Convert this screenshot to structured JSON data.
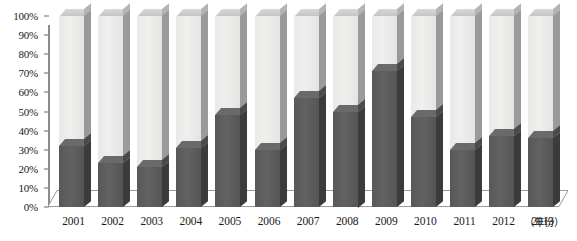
{
  "chart_data": {
    "type": "bar",
    "title": "",
    "subtitle": "",
    "xlabel": "（年份）",
    "ylabel": "",
    "ylim": [
      0,
      100
    ],
    "grid": false,
    "legend_position": "none",
    "stacked": true,
    "y_unit": "%",
    "categories": [
      "2001",
      "2002",
      "2003",
      "2004",
      "2005",
      "2006",
      "2007",
      "2008",
      "2009",
      "2010",
      "2011",
      "2012",
      "2013"
    ],
    "y_ticks": [
      "0%",
      "10%",
      "20%",
      "30%",
      "40%",
      "50%",
      "60%",
      "70%",
      "80%",
      "90%",
      "100%"
    ],
    "y_tick_values": [
      0,
      10,
      20,
      30,
      40,
      50,
      60,
      70,
      80,
      90,
      100
    ],
    "series": [
      {
        "name": "dark-segment",
        "color": "#5a5a5a",
        "values": [
          32,
          23,
          21,
          31,
          48,
          30,
          57,
          50,
          71,
          47,
          30,
          37,
          36
        ]
      },
      {
        "name": "light-segment",
        "color": "#ececea",
        "values": [
          68,
          77,
          79,
          69,
          52,
          70,
          43,
          50,
          29,
          53,
          70,
          63,
          64
        ]
      }
    ],
    "values": [
      32,
      23,
      21,
      31,
      48,
      30,
      57,
      50,
      71,
      47,
      30,
      37,
      36
    ],
    "annotations": []
  },
  "axis": {
    "x_unit_label": "（年份）"
  },
  "colors": {
    "dark_front": "#5a5a5a",
    "dark_side": "#3b3b3b",
    "light_front": "#ececea",
    "light_side": "#9a9a9a",
    "axis_line": "#8c8c8c",
    "text": "#1a1a1a"
  }
}
